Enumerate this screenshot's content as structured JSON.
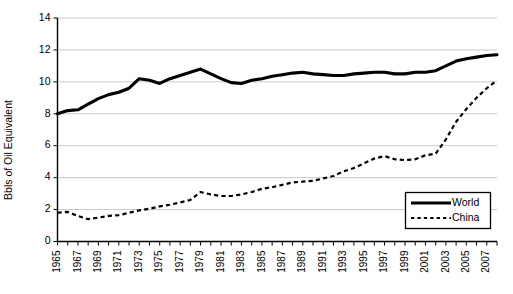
{
  "chart_data": {
    "type": "line",
    "title": "",
    "xlabel": "",
    "ylabel": "Bbls of Oil Equivalent",
    "ylim": [
      0,
      14
    ],
    "ytick_values": [
      0,
      2,
      4,
      6,
      8,
      10,
      12,
      14
    ],
    "ytick_labels": [
      "0",
      "2",
      "4",
      "6",
      "8",
      "10",
      "12",
      "14"
    ],
    "grid": "horizontal",
    "legend_position": "bottom-right",
    "x": [
      1965,
      1966,
      1967,
      1968,
      1969,
      1970,
      1971,
      1972,
      1973,
      1974,
      1975,
      1976,
      1977,
      1978,
      1979,
      1980,
      1981,
      1982,
      1983,
      1984,
      1985,
      1986,
      1987,
      1988,
      1989,
      1990,
      1991,
      1992,
      1993,
      1994,
      1995,
      1996,
      1997,
      1998,
      1999,
      2000,
      2001,
      2002,
      2003,
      2004,
      2005,
      2006,
      2007,
      2008
    ],
    "xtick_labels": [
      "1965",
      "1967",
      "1969",
      "1971",
      "1973",
      "1975",
      "1977",
      "1979",
      "1981",
      "1983",
      "1985",
      "1987",
      "1989",
      "1991",
      "1993",
      "1995",
      "1997",
      "1999",
      "2001",
      "2003",
      "2005",
      "2007"
    ],
    "series": [
      {
        "name": "World",
        "style": "solid",
        "color": "#000000",
        "values": [
          8.0,
          8.2,
          8.25,
          8.6,
          8.95,
          9.2,
          9.35,
          9.6,
          10.2,
          10.1,
          9.9,
          10.2,
          10.4,
          10.6,
          10.8,
          10.5,
          10.2,
          9.95,
          9.9,
          10.1,
          10.2,
          10.35,
          10.45,
          10.55,
          10.6,
          10.5,
          10.45,
          10.4,
          10.4,
          10.5,
          10.55,
          10.6,
          10.6,
          10.5,
          10.5,
          10.6,
          10.6,
          10.7,
          11.0,
          11.3,
          11.45,
          11.55,
          11.65,
          11.7
        ]
      },
      {
        "name": "China",
        "style": "dotted",
        "color": "#000000",
        "values": [
          1.8,
          1.85,
          1.6,
          1.4,
          1.5,
          1.6,
          1.65,
          1.8,
          1.95,
          2.05,
          2.2,
          2.3,
          2.45,
          2.6,
          3.1,
          2.95,
          2.85,
          2.85,
          2.95,
          3.1,
          3.3,
          3.4,
          3.55,
          3.7,
          3.75,
          3.8,
          3.95,
          4.1,
          4.4,
          4.6,
          4.9,
          5.2,
          5.35,
          5.15,
          5.1,
          5.15,
          5.4,
          5.5,
          6.4,
          7.5,
          8.3,
          9.0,
          9.6,
          10.1
        ]
      }
    ]
  }
}
